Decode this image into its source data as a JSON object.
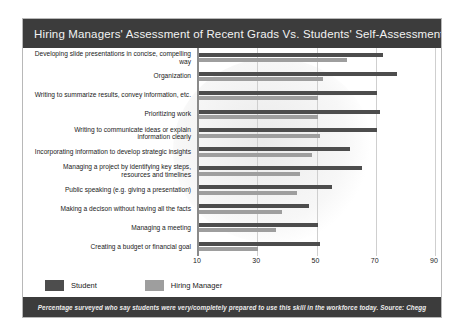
{
  "card": {
    "title": "Hiring Managers' Assessment of Recent Grads Vs. Students' Self-Assessment",
    "footnote": "Percentage surveyed who say students were very/completely prepared to use this skill in the workforce today. Source: Chegg"
  },
  "legend": {
    "student_label": "Student",
    "manager_label": "Hiring Manager",
    "student_color": "#4d4d4d",
    "manager_color": "#9e9e9e"
  },
  "chart_data": {
    "type": "bar",
    "orientation": "horizontal",
    "title": "Hiring Managers' Assessment of Recent Grads Vs. Students' Self-Assessment",
    "xlabel": "",
    "ylabel": "",
    "xlim": [
      10,
      90
    ],
    "xticks": [
      10,
      30,
      50,
      70,
      90
    ],
    "xtick_labels": [
      "10",
      "30",
      "50",
      "70",
      "90"
    ],
    "grid": true,
    "legend_position": "bottom-left",
    "annotation": "Percentage surveyed who say students were very/completely prepared to use this skill in the workforce today. Source: Chegg",
    "categories": [
      "Developing slide presentations in concise, compelling way",
      "Organization",
      "Writing to summarize results, convey information, etc.",
      "Prioritizing work",
      "Writing to communicate ideas or explain\ninformation clearly",
      "Incorporating information to develop strategic insights",
      "Managing a project by identifying key steps,\nresources and timelines",
      "Public speaking (e.g. giving a presentation)",
      "Making a decison without having all the facts",
      "Managing a meeting",
      "Creating a budget or financial goal"
    ],
    "series": [
      {
        "name": "Student",
        "color": "#4d4d4d",
        "values": [
          72,
          77,
          70,
          71,
          70,
          61,
          65,
          55,
          47,
          50,
          51
        ]
      },
      {
        "name": "Hiring Manager",
        "color": "#9e9e9e",
        "values": [
          60,
          52,
          50,
          50,
          51,
          48,
          44,
          43,
          38,
          36,
          30
        ]
      }
    ]
  }
}
